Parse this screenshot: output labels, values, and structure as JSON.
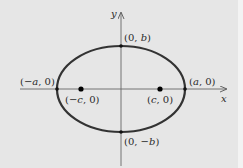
{
  "diagram": {
    "type": "ellipse-with-foci",
    "axes": {
      "x_label": "x",
      "y_label": "y"
    },
    "vertices": {
      "right": {
        "label": "(a, 0)",
        "var": "a"
      },
      "left": {
        "label": "(−a, 0)",
        "var": "−a"
      },
      "top": {
        "label": "(0, b)",
        "var": "b"
      },
      "bottom": {
        "label": "(0, −b)",
        "var": "−b"
      }
    },
    "foci": {
      "right": {
        "label": "(c, 0)",
        "var": "c"
      },
      "left": {
        "label": "(−c, 0)",
        "var": "−c"
      }
    },
    "colors": {
      "background": "#e6e6e6",
      "curve": "#333333",
      "axes": "#555555"
    }
  }
}
